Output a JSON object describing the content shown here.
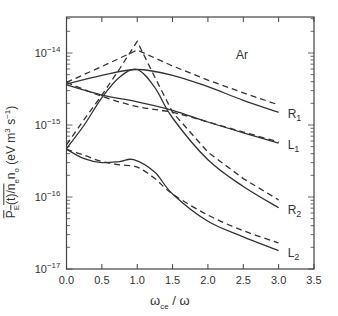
{
  "chart_data": {
    "type": "line",
    "title": "",
    "annotation": "Ar",
    "xlabel": "ωce / ω",
    "ylabel": "P_E(t)/n_e n_o (eV m^3 s^-1)",
    "xlim": [
      0.0,
      3.5
    ],
    "ylim": [
      1e-17,
      3e-14
    ],
    "yscale": "log",
    "grid": false,
    "legend": "none (curves labeled inline at right: R1, L1, R2, L2)",
    "x_ticks": [
      "0.0",
      "0.5",
      "1.0",
      "1.5",
      "2.0",
      "2.5",
      "3.0",
      "3.5"
    ],
    "y_ticks": [
      "10^-17",
      "10^-16",
      "10^-15",
      "10^-14"
    ],
    "series": [
      {
        "name": "R1",
        "style": "solid",
        "x": [
          0.0,
          0.5,
          1.0,
          1.5,
          2.0,
          2.5,
          3.0
        ],
        "y": [
          3.7e-15,
          4.9e-15,
          5.9e-15,
          4.9e-15,
          3.4e-15,
          2.2e-15,
          1.5e-15
        ]
      },
      {
        "name": "R1",
        "style": "dashed",
        "x": [
          0.0,
          0.5,
          1.0,
          1.5,
          2.0,
          2.5,
          3.0
        ],
        "y": [
          3.9e-15,
          6.5e-15,
          1.1e-14,
          6.6e-15,
          4.2e-15,
          2.8e-15,
          1.9e-15
        ]
      },
      {
        "name": "L1",
        "style": "solid",
        "x": [
          0.0,
          0.5,
          1.0,
          1.5,
          2.0,
          2.5,
          3.0
        ],
        "y": [
          3.6e-15,
          2.6e-15,
          2.1e-15,
          1.6e-15,
          1.1e-15,
          7.8e-16,
          5.6e-16
        ]
      },
      {
        "name": "L1",
        "style": "dashed",
        "x": [
          0.0,
          0.5,
          1.0,
          1.5,
          2.0,
          2.5,
          3.0
        ],
        "y": [
          3.9e-15,
          2.5e-15,
          1.8e-15,
          1.5e-15,
          1.1e-15,
          8e-16,
          5.8e-16
        ]
      },
      {
        "name": "R2",
        "style": "solid",
        "x": [
          0.0,
          0.25,
          0.5,
          0.75,
          1.0,
          1.25,
          1.5,
          2.0,
          2.5,
          3.0
        ],
        "y": [
          4.7e-16,
          1e-15,
          2.4e-15,
          4.6e-15,
          5.9e-15,
          3.3e-15,
          1.25e-15,
          3.3e-16,
          1.4e-16,
          7.1e-17
        ]
      },
      {
        "name": "R2",
        "style": "dashed",
        "x": [
          0.0,
          0.25,
          0.5,
          0.75,
          1.0,
          1.25,
          1.5,
          2.0,
          2.5,
          3.0
        ],
        "y": [
          5.3e-16,
          1.2e-15,
          2.6e-15,
          6e-15,
          1.45e-14,
          4.6e-15,
          1.5e-15,
          4.2e-16,
          1.8e-16,
          9.1e-17
        ]
      },
      {
        "name": "L2",
        "style": "solid",
        "x": [
          0.0,
          0.25,
          0.5,
          0.75,
          0.95,
          1.25,
          1.5,
          2.0,
          2.5,
          3.0
        ],
        "y": [
          4.6e-16,
          3.4e-16,
          3e-16,
          3.1e-16,
          3.3e-16,
          2.2e-16,
          1.1e-16,
          4.6e-17,
          2.8e-17,
          1.8e-17
        ]
      },
      {
        "name": "L2",
        "style": "dashed",
        "x": [
          0.0,
          0.25,
          0.5,
          0.75,
          1.0,
          1.25,
          1.5,
          2.0,
          2.5,
          3.0
        ],
        "y": [
          4.6e-16,
          3.8e-16,
          3.1e-16,
          2.8e-16,
          2.6e-16,
          1.8e-16,
          1.1e-16,
          5.6e-17,
          3.4e-17,
          2.3e-17
        ]
      }
    ],
    "series_labels": [
      {
        "text": "R",
        "sub": "1",
        "at_y": 1.5e-15
      },
      {
        "text": "L",
        "sub": "1",
        "at_y": 5.6e-16
      },
      {
        "text": "R",
        "sub": "2",
        "at_y": 7.1e-17
      },
      {
        "text": "L",
        "sub": "2",
        "at_y": 1.8e-17
      }
    ]
  },
  "labels": {
    "annotation": "Ar",
    "ylabel_main": "P",
    "ylabel_sub": "E",
    "ylabel_rest": "(t)/n",
    "ylabel_ne_sub": "e",
    "ylabel_n": "n",
    "ylabel_no_sub": "o",
    "ylabel_units": " (eV m",
    "ylabel_units_sup": "3",
    "ylabel_units2": " s",
    "ylabel_units_sup2": "−1",
    "ylabel_close": ")",
    "xlabel_omega": "ω",
    "xlabel_sub": "ce",
    "xlabel_rest": " / ω"
  }
}
